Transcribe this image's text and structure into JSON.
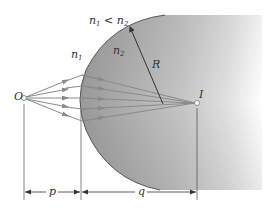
{
  "diagram": {
    "type": "refraction-at-spherical-surface",
    "labels": {
      "object": "O",
      "image": "I",
      "condition_n1": "n",
      "condition_sub1": "1",
      "condition_op": " < ",
      "condition_n2": "n",
      "condition_sub2": "2",
      "medium1": "n",
      "medium1_sub": "1",
      "medium2": "n",
      "medium2_sub": "2",
      "radius": "R",
      "object_distance": "p",
      "image_distance": "q"
    },
    "colors": {
      "background": "#ffffff",
      "medium2_fill": "#a9a9a9",
      "medium2_fade": "#ffffff",
      "rays": "#888888",
      "outline": "#555555",
      "text": "#333333"
    },
    "ray_count": 5
  }
}
